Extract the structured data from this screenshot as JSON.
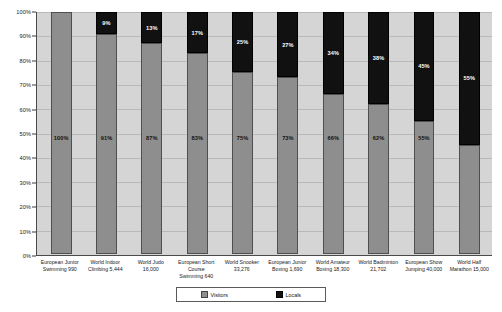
{
  "chart_data": {
    "type": "bar",
    "subtype": "stacked-percentage",
    "title": "",
    "xlabel": "",
    "ylabel": "",
    "ylim": [
      0,
      100
    ],
    "grid": true,
    "legend_position": "bottom",
    "y_ticks": [
      "0%",
      "10%",
      "20%",
      "30%",
      "40%",
      "50%",
      "60%",
      "70%",
      "80%",
      "90%",
      "100%"
    ],
    "y_tick_values": [
      0,
      10,
      20,
      30,
      40,
      50,
      60,
      70,
      80,
      90,
      100
    ],
    "categories": [
      "European Junior Swimming 990",
      "World Indoor Climbing  5,444",
      "World Judo 16,000",
      "European Short Course Swimming 640",
      "World Snooker 33,276",
      "European Junior Boxing 1,690",
      "World Amateur Boxing 18,300",
      "World Badminton 21,702",
      "European Show Jumping 40,000",
      "World Half Marathon 15,000"
    ],
    "category_lines": [
      [
        "European Junior",
        "Swimming 990"
      ],
      [
        "World Indoor",
        "Climbing  5,444"
      ],
      [
        "World Judo",
        "16,000"
      ],
      [
        "European Short",
        "Course",
        "Swimming 640"
      ],
      [
        "World Snooker",
        "33,276"
      ],
      [
        "European Junior",
        "Boxing  1,690"
      ],
      [
        "World Amateur",
        "Boxing 18,300"
      ],
      [
        "World Badminton",
        "21,702"
      ],
      [
        "European Show",
        "Jumping 40,000"
      ],
      [
        "World Half",
        "Marathon 15,000"
      ]
    ],
    "series": [
      {
        "name": "Visitors",
        "color": "#8e8e8e",
        "values": [
          100,
          91,
          87,
          83,
          75,
          73,
          66,
          62,
          55,
          45
        ],
        "labels": [
          "100%",
          "91%",
          "87%",
          "83%",
          "75%",
          "73%",
          "66%",
          "62%",
          "55%",
          "45%"
        ]
      },
      {
        "name": "Locals",
        "color": "#111111",
        "values": [
          0,
          9,
          13,
          17,
          25,
          27,
          34,
          38,
          45,
          55
        ],
        "labels": [
          "",
          "9%",
          "13%",
          "17%",
          "25%",
          "27%",
          "34%",
          "38%",
          "45%",
          "55%"
        ]
      }
    ]
  },
  "legend": {
    "items": [
      {
        "label": "Visitors",
        "swatch": "visitors"
      },
      {
        "label": "Locals",
        "swatch": "locals"
      }
    ]
  }
}
